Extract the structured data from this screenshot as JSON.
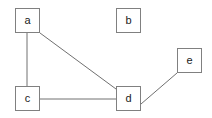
{
  "diagram": {
    "width": 212,
    "height": 118,
    "background_color": "#ffffff",
    "node_border_color": "#808080",
    "node_fill_color": "#ffffff",
    "edge_color": "#707070",
    "label_color": "#1a1a1a",
    "nodes": [
      {
        "id": "a",
        "label": "a",
        "x": 15,
        "y": 8,
        "w": 25,
        "h": 25
      },
      {
        "id": "b",
        "label": "b",
        "x": 116,
        "y": 8,
        "w": 25,
        "h": 25
      },
      {
        "id": "c",
        "label": "c",
        "x": 15,
        "y": 86,
        "w": 25,
        "h": 25
      },
      {
        "id": "d",
        "label": "d",
        "x": 116,
        "y": 86,
        "w": 25,
        "h": 25
      },
      {
        "id": "e",
        "label": "e",
        "x": 177,
        "y": 48,
        "w": 25,
        "h": 25
      }
    ],
    "edges": [
      {
        "from": "a",
        "to": "c",
        "x1": 27,
        "y1": 33,
        "x2": 27,
        "y2": 86
      },
      {
        "from": "a",
        "to": "d",
        "x1": 40,
        "y1": 33,
        "x2": 116,
        "y2": 89
      },
      {
        "from": "c",
        "to": "d",
        "x1": 40,
        "y1": 99,
        "x2": 116,
        "y2": 99
      },
      {
        "from": "d",
        "to": "e",
        "x1": 141,
        "y1": 104,
        "x2": 177,
        "y2": 73
      }
    ]
  },
  "chart_data": {
    "type": "diagram",
    "graph_type": "undirected",
    "title": "",
    "node_count": 5,
    "edge_count": 4,
    "nodes": [
      "a",
      "b",
      "c",
      "d",
      "e"
    ],
    "edges": [
      [
        "a",
        "c"
      ],
      [
        "a",
        "d"
      ],
      [
        "c",
        "d"
      ],
      [
        "d",
        "e"
      ]
    ],
    "isolated_nodes": [
      "b"
    ],
    "adjacency": {
      "a": [
        "c",
        "d"
      ],
      "b": [],
      "c": [
        "a",
        "d"
      ],
      "d": [
        "a",
        "c",
        "e"
      ],
      "e": [
        "d"
      ]
    },
    "degrees": {
      "a": 2,
      "b": 0,
      "c": 2,
      "d": 3,
      "e": 1
    }
  }
}
